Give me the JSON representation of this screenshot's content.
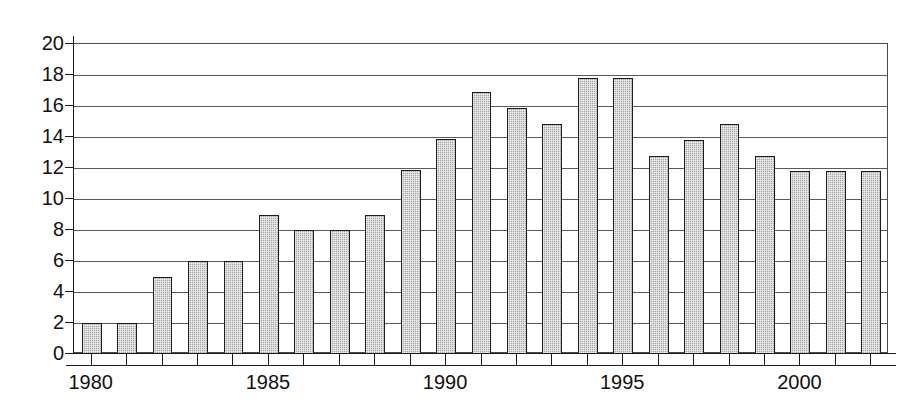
{
  "chart_data": {
    "type": "bar",
    "title": "",
    "subtitle": "",
    "xlabel": "",
    "ylabel": "",
    "grid": true,
    "legend": null,
    "legend_position": "none",
    "xlim": [
      1979.5,
      2002.5
    ],
    "ylim": [
      0,
      20
    ],
    "y_tick_step": 2,
    "y_ticks": [
      0,
      2,
      4,
      6,
      8,
      10,
      12,
      14,
      16,
      18,
      20
    ],
    "y_tick_labels": [
      "0",
      "2",
      "4",
      "6",
      "8",
      "10",
      "12",
      "14",
      "16",
      "18",
      "20"
    ],
    "x_tick_labels": [
      "1980",
      "1985",
      "1990",
      "1995",
      "2000"
    ],
    "x_tick_values": [
      1980,
      1985,
      1990,
      1995,
      2000
    ],
    "categories": [
      "1980",
      "1981",
      "1982",
      "1983",
      "1984",
      "1985",
      "1986",
      "1987",
      "1988",
      "1989",
      "1990",
      "1991",
      "1992",
      "1993",
      "1994",
      "1995",
      "1996",
      "1997",
      "1998",
      "1999",
      "2000",
      "2001",
      "2002"
    ],
    "values": [
      2.0,
      2.0,
      5.0,
      6.0,
      6.0,
      9.0,
      8.0,
      8.0,
      9.0,
      11.9,
      13.9,
      16.9,
      15.9,
      14.85,
      17.8,
      17.8,
      12.75,
      13.8,
      14.85,
      12.75,
      11.8,
      11.8,
      11.8
    ],
    "bar_fill_color": "#a8a8a8",
    "bar_edge_color": "#1c1c1c",
    "axis_color": "#1a1a1a",
    "grid_color": "#5a5a5a",
    "background_color": "#ffffff"
  }
}
